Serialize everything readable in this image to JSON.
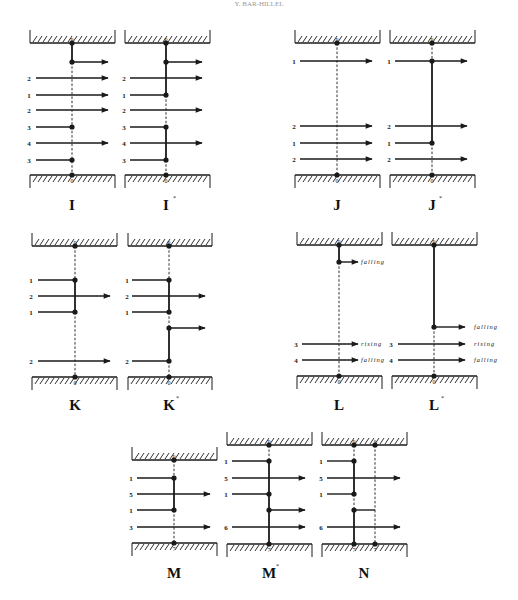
{
  "header": {
    "text": "Y. BAR-HILLEL"
  },
  "colors": {
    "ink": "#1a1a1a",
    "background": "#ffffff"
  },
  "panels": [
    {
      "id": "I",
      "caption": "I",
      "star": false,
      "box": {
        "x1": 30,
        "x2": 115,
        "top": 43,
        "bottom": 175
      },
      "verticals": [
        {
          "x": 72,
          "top_label": "p",
          "bottom_label": "0",
          "segments": [
            {
              "y1": 43,
              "y2": 62,
              "style": "solid"
            },
            {
              "y1": 62,
              "y2": 175,
              "style": "dashed"
            }
          ]
        }
      ],
      "dots": [
        [
          72,
          43
        ],
        [
          72,
          62
        ],
        [
          72,
          127
        ],
        [
          72,
          160
        ],
        [
          72,
          175
        ]
      ],
      "rows": [
        {
          "y": 62,
          "label": "",
          "from": 72,
          "to": 108,
          "arrow": true,
          "tag": ""
        },
        {
          "y": 78,
          "label": "2",
          "from": 36,
          "to": 108,
          "arrow": true,
          "tag": ""
        },
        {
          "y": 95,
          "label": "1",
          "from": 36,
          "to": 108,
          "arrow": true,
          "tag": ""
        },
        {
          "y": 110,
          "label": "2",
          "from": 36,
          "to": 108,
          "arrow": true,
          "tag": ""
        },
        {
          "y": 127,
          "label": "3",
          "from": 36,
          "to": 72,
          "arrow": false,
          "tag": ""
        },
        {
          "y": 143,
          "label": "4",
          "from": 36,
          "to": 108,
          "arrow": true,
          "tag": ""
        },
        {
          "y": 160,
          "label": "3",
          "from": 36,
          "to": 72,
          "arrow": false,
          "tag": ""
        }
      ],
      "caption_pos": [
        72,
        210
      ]
    },
    {
      "id": "I*",
      "caption": "I",
      "star": true,
      "box": {
        "x1": 125,
        "x2": 210,
        "top": 43,
        "bottom": 175
      },
      "verticals": [
        {
          "x": 166,
          "top_label": "p",
          "bottom_label": "0",
          "segments": [
            {
              "y1": 43,
              "y2": 95,
              "style": "solid"
            },
            {
              "y1": 95,
              "y2": 127,
              "style": "dashed"
            },
            {
              "y1": 127,
              "y2": 160,
              "style": "solid"
            },
            {
              "y1": 160,
              "y2": 175,
              "style": "dashed"
            }
          ]
        }
      ],
      "dots": [
        [
          166,
          43
        ],
        [
          166,
          62
        ],
        [
          166,
          95
        ],
        [
          166,
          127
        ],
        [
          166,
          160
        ],
        [
          166,
          175
        ]
      ],
      "rows": [
        {
          "y": 62,
          "label": "",
          "from": 166,
          "to": 202,
          "arrow": true,
          "tag": ""
        },
        {
          "y": 78,
          "label": "2",
          "from": 130,
          "to": 202,
          "arrow": true,
          "tag": ""
        },
        {
          "y": 95,
          "label": "1",
          "from": 130,
          "to": 166,
          "arrow": false,
          "tag": ""
        },
        {
          "y": 110,
          "label": "2",
          "from": 130,
          "to": 202,
          "arrow": true,
          "tag": ""
        },
        {
          "y": 127,
          "label": "3",
          "from": 130,
          "to": 166,
          "arrow": false,
          "tag": ""
        },
        {
          "y": 143,
          "label": "4",
          "from": 130,
          "to": 202,
          "arrow": true,
          "tag": ""
        },
        {
          "y": 160,
          "label": "3",
          "from": 130,
          "to": 166,
          "arrow": false,
          "tag": ""
        }
      ],
      "caption_pos": [
        166,
        210
      ]
    },
    {
      "id": "J",
      "caption": "J",
      "star": false,
      "box": {
        "x1": 295,
        "x2": 380,
        "top": 43,
        "bottom": 175
      },
      "verticals": [
        {
          "x": 337,
          "top_label": "p",
          "bottom_label": "0",
          "segments": [
            {
              "y1": 43,
              "y2": 175,
              "style": "dashed"
            }
          ]
        }
      ],
      "dots": [
        [
          337,
          43
        ],
        [
          337,
          175
        ]
      ],
      "rows": [
        {
          "y": 61,
          "label": "1",
          "from": 300,
          "to": 372,
          "arrow": true,
          "tag": ""
        },
        {
          "y": 126,
          "label": "2",
          "from": 300,
          "to": 372,
          "arrow": true,
          "tag": ""
        },
        {
          "y": 143,
          "label": "1",
          "from": 300,
          "to": 372,
          "arrow": true,
          "tag": ""
        },
        {
          "y": 159,
          "label": "2",
          "from": 300,
          "to": 372,
          "arrow": true,
          "tag": ""
        }
      ],
      "caption_pos": [
        337,
        210
      ]
    },
    {
      "id": "J*",
      "caption": "J",
      "star": true,
      "box": {
        "x1": 390,
        "x2": 475,
        "top": 43,
        "bottom": 175
      },
      "verticals": [
        {
          "x": 432,
          "top_label": "p",
          "bottom_label": "0",
          "segments": [
            {
              "y1": 43,
              "y2": 61,
              "style": "dashed"
            },
            {
              "y1": 61,
              "y2": 143,
              "style": "solid"
            },
            {
              "y1": 143,
              "y2": 175,
              "style": "dashed"
            }
          ]
        }
      ],
      "dots": [
        [
          432,
          43
        ],
        [
          432,
          61
        ],
        [
          432,
          143
        ],
        [
          432,
          175
        ]
      ],
      "rows": [
        {
          "y": 61,
          "label": "1",
          "from": 395,
          "to": 467,
          "arrow": true,
          "tag": ""
        },
        {
          "y": 126,
          "label": "2",
          "from": 395,
          "to": 467,
          "arrow": true,
          "tag": ""
        },
        {
          "y": 143,
          "label": "1",
          "from": 395,
          "to": 432,
          "arrow": false,
          "tag": ""
        },
        {
          "y": 159,
          "label": "2",
          "from": 395,
          "to": 467,
          "arrow": true,
          "tag": ""
        }
      ],
      "caption_pos": [
        432,
        210
      ]
    },
    {
      "id": "K",
      "caption": "K",
      "star": false,
      "box": {
        "x1": 32,
        "x2": 117,
        "top": 246,
        "bottom": 377
      },
      "verticals": [
        {
          "x": 75,
          "top_label": "p",
          "bottom_label": "0",
          "segments": [
            {
              "y1": 246,
              "y2": 280,
              "style": "dashed"
            },
            {
              "y1": 280,
              "y2": 312,
              "style": "solid"
            },
            {
              "y1": 312,
              "y2": 377,
              "style": "dashed"
            }
          ]
        }
      ],
      "dots": [
        [
          75,
          246
        ],
        [
          75,
          280
        ],
        [
          75,
          312
        ],
        [
          75,
          377
        ]
      ],
      "rows": [
        {
          "y": 280,
          "label": "1",
          "from": 38,
          "to": 75,
          "arrow": false,
          "tag": ""
        },
        {
          "y": 296,
          "label": "2",
          "from": 38,
          "to": 110,
          "arrow": true,
          "tag": ""
        },
        {
          "y": 312,
          "label": "1",
          "from": 38,
          "to": 75,
          "arrow": false,
          "tag": ""
        },
        {
          "y": 361,
          "label": "2",
          "from": 38,
          "to": 110,
          "arrow": true,
          "tag": ""
        }
      ],
      "caption_pos": [
        75,
        410
      ]
    },
    {
      "id": "K*",
      "caption": "K",
      "star": true,
      "box": {
        "x1": 128,
        "x2": 212,
        "top": 246,
        "bottom": 377
      },
      "verticals": [
        {
          "x": 169,
          "top_label": "p",
          "bottom_label": "0",
          "segments": [
            {
              "y1": 246,
              "y2": 280,
              "style": "dashed"
            },
            {
              "y1": 280,
              "y2": 312,
              "style": "solid"
            },
            {
              "y1": 312,
              "y2": 328,
              "style": "dashed"
            },
            {
              "y1": 328,
              "y2": 361,
              "style": "solid"
            },
            {
              "y1": 361,
              "y2": 377,
              "style": "dashed"
            }
          ]
        }
      ],
      "dots": [
        [
          169,
          246
        ],
        [
          169,
          280
        ],
        [
          169,
          312
        ],
        [
          169,
          328
        ],
        [
          169,
          361
        ],
        [
          169,
          377
        ]
      ],
      "rows": [
        {
          "y": 280,
          "label": "1",
          "from": 132,
          "to": 169,
          "arrow": false,
          "tag": ""
        },
        {
          "y": 296,
          "label": "2",
          "from": 132,
          "to": 205,
          "arrow": true,
          "tag": ""
        },
        {
          "y": 312,
          "label": "1",
          "from": 132,
          "to": 169,
          "arrow": false,
          "tag": ""
        },
        {
          "y": 328,
          "label": "",
          "from": 169,
          "to": 205,
          "arrow": true,
          "tag": ""
        },
        {
          "y": 361,
          "label": "2",
          "from": 132,
          "to": 169,
          "arrow": false,
          "tag": ""
        }
      ],
      "caption_pos": [
        169,
        410
      ]
    },
    {
      "id": "L",
      "caption": "L",
      "star": false,
      "box": {
        "x1": 297,
        "x2": 382,
        "top": 245,
        "bottom": 376
      },
      "verticals": [
        {
          "x": 339,
          "top_label": "p",
          "bottom_label": "0",
          "segments": [
            {
              "y1": 245,
              "y2": 262,
              "style": "solid"
            },
            {
              "y1": 262,
              "y2": 376,
              "style": "dashed"
            }
          ]
        }
      ],
      "dots": [
        [
          339,
          245
        ],
        [
          339,
          262
        ],
        [
          339,
          376
        ]
      ],
      "rows": [
        {
          "y": 262,
          "label": "",
          "from": 339,
          "to": 358,
          "arrow": true,
          "tag": "falling",
          "tag_x": 361
        },
        {
          "y": 344,
          "label": "3",
          "from": 302,
          "to": 358,
          "arrow": true,
          "tag": "rising",
          "tag_x": 361
        },
        {
          "y": 360,
          "label": "4",
          "from": 302,
          "to": 358,
          "arrow": true,
          "tag": "falling",
          "tag_x": 361
        }
      ],
      "caption_pos": [
        339,
        410
      ]
    },
    {
      "id": "L*",
      "caption": "L",
      "star": true,
      "box": {
        "x1": 392,
        "x2": 477,
        "top": 245,
        "bottom": 376
      },
      "verticals": [
        {
          "x": 434,
          "top_label": "p",
          "bottom_label": "0",
          "segments": [
            {
              "y1": 245,
              "y2": 327,
              "style": "solid"
            },
            {
              "y1": 327,
              "y2": 376,
              "style": "dashed"
            }
          ]
        }
      ],
      "dots": [
        [
          434,
          245
        ],
        [
          434,
          327
        ],
        [
          434,
          376
        ]
      ],
      "rows": [
        {
          "y": 327,
          "label": "",
          "from": 434,
          "to": 465,
          "arrow": true,
          "tag": "falling",
          "tag_x": 474
        },
        {
          "y": 344,
          "label": "3",
          "from": 398,
          "to": 465,
          "arrow": true,
          "tag": "rising",
          "tag_x": 474
        },
        {
          "y": 360,
          "label": "4",
          "from": 398,
          "to": 465,
          "arrow": true,
          "tag": "falling",
          "tag_x": 474
        }
      ],
      "caption_pos": [
        434,
        410
      ]
    },
    {
      "id": "M",
      "caption": "M",
      "star": false,
      "box": {
        "x1": 132,
        "x2": 217,
        "top": 460,
        "bottom": 543
      },
      "verticals": [
        {
          "x": 174,
          "top_label": "p",
          "bottom_label": "7",
          "segments": [
            {
              "y1": 460,
              "y2": 478,
              "style": "dashed"
            },
            {
              "y1": 478,
              "y2": 510,
              "style": "solid"
            },
            {
              "y1": 510,
              "y2": 543,
              "style": "dashed"
            }
          ]
        }
      ],
      "dots": [
        [
          174,
          460
        ],
        [
          174,
          478
        ],
        [
          174,
          510
        ],
        [
          174,
          543
        ]
      ],
      "rows": [
        {
          "y": 478,
          "label": "1",
          "from": 137,
          "to": 174,
          "arrow": false,
          "tag": ""
        },
        {
          "y": 494,
          "label": "5",
          "from": 137,
          "to": 210,
          "arrow": true,
          "tag": ""
        },
        {
          "y": 510,
          "label": "1",
          "from": 137,
          "to": 174,
          "arrow": false,
          "tag": ""
        },
        {
          "y": 527,
          "label": "3",
          "from": 137,
          "to": 210,
          "arrow": true,
          "tag": ""
        }
      ],
      "caption_pos": [
        174,
        578
      ]
    },
    {
      "id": "M*",
      "caption": "M",
      "star": true,
      "box": {
        "x1": 227,
        "x2": 312,
        "top": 445,
        "bottom": 544
      },
      "verticals": [
        {
          "x": 269,
          "top_label": "p",
          "bottom_label": "7",
          "segments": [
            {
              "y1": 445,
              "y2": 461,
              "style": "dashed"
            },
            {
              "y1": 461,
              "y2": 544,
              "style": "solid"
            }
          ]
        }
      ],
      "dots": [
        [
          269,
          445
        ],
        [
          269,
          461
        ],
        [
          269,
          494
        ],
        [
          269,
          510
        ],
        [
          269,
          544
        ]
      ],
      "rows": [
        {
          "y": 461,
          "label": "1",
          "from": 232,
          "to": 269,
          "arrow": false,
          "tag": ""
        },
        {
          "y": 478,
          "label": "5",
          "from": 232,
          "to": 305,
          "arrow": true,
          "tag": ""
        },
        {
          "y": 494,
          "label": "1",
          "from": 232,
          "to": 269,
          "arrow": false,
          "tag": ""
        },
        {
          "y": 510,
          "label": "",
          "from": 269,
          "to": 305,
          "arrow": true,
          "tag": ""
        },
        {
          "y": 527,
          "label": "6",
          "from": 232,
          "to": 305,
          "arrow": true,
          "tag": ""
        }
      ],
      "caption_pos": [
        269,
        578
      ]
    },
    {
      "id": "N",
      "caption": "N",
      "star": false,
      "box": {
        "x1": 322,
        "x2": 407,
        "top": 445,
        "bottom": 544
      },
      "verticals": [
        {
          "x": 354,
          "top_label": "p",
          "bottom_label": "7",
          "segments": [
            {
              "y1": 445,
              "y2": 461,
              "style": "dashed"
            },
            {
              "y1": 461,
              "y2": 494,
              "style": "solid"
            },
            {
              "y1": 494,
              "y2": 510,
              "style": "dashed"
            },
            {
              "y1": 510,
              "y2": 544,
              "style": "solid"
            }
          ]
        },
        {
          "x": 375,
          "top_label": "s",
          "bottom_label": "7",
          "segments": [
            {
              "y1": 445,
              "y2": 510,
              "style": "dashed"
            },
            {
              "y1": 510,
              "y2": 544,
              "style": "dashed"
            }
          ]
        }
      ],
      "dots": [
        [
          354,
          445
        ],
        [
          375,
          445
        ],
        [
          354,
          461
        ],
        [
          354,
          494
        ],
        [
          354,
          510
        ],
        [
          354,
          544
        ],
        [
          375,
          544
        ]
      ],
      "rows": [
        {
          "y": 461,
          "label": "1",
          "from": 327,
          "to": 354,
          "arrow": false,
          "tag": ""
        },
        {
          "y": 478,
          "label": "5",
          "from": 327,
          "to": 400,
          "arrow": true,
          "tag": ""
        },
        {
          "y": 494,
          "label": "1",
          "from": 327,
          "to": 354,
          "arrow": false,
          "tag": ""
        },
        {
          "y": 510,
          "label": "",
          "from": 354,
          "to": 375,
          "arrow": false,
          "tag": ""
        },
        {
          "y": 527,
          "label": "6",
          "from": 327,
          "to": 400,
          "arrow": true,
          "tag": ""
        }
      ],
      "caption_pos": [
        364,
        578
      ]
    }
  ]
}
